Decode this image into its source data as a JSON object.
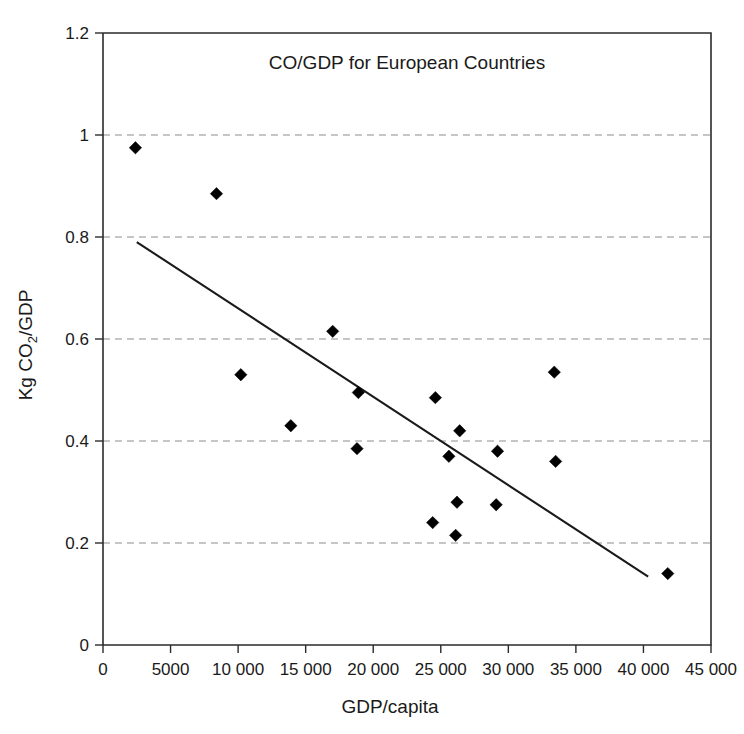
{
  "chart_data": {
    "type": "scatter",
    "title": "CO/GDP for European Countries",
    "xlabel": "GDP/capita",
    "ylabel": "Kg CO2/GDP",
    "ylabel_parts": {
      "prefix": "Kg CO",
      "sub": "2",
      "suffix": "/GDP"
    },
    "xlim": [
      0,
      45000
    ],
    "ylim": [
      0,
      1.2
    ],
    "grid": "horizontal-dashed",
    "legend": "none",
    "x_ticks": [
      0,
      5000,
      10000,
      15000,
      20000,
      25000,
      30000,
      35000,
      40000,
      45000
    ],
    "x_tick_labels": [
      "0",
      "5000",
      "10 000",
      "15 000",
      "20 000",
      "25 000",
      "30 000",
      "35 000",
      "40 000",
      "45 000"
    ],
    "y_ticks": [
      0,
      0.2,
      0.4,
      0.6,
      0.8,
      1,
      1.2
    ],
    "y_tick_labels": [
      "0",
      "0.2",
      "0.4",
      "0.6",
      "0.8",
      "1",
      "1.2"
    ],
    "marker_shape": "diamond",
    "marker_color": "#000000",
    "series": [
      {
        "name": "European countries",
        "points": [
          {
            "x": 2400,
            "y": 0.975
          },
          {
            "x": 8400,
            "y": 0.885
          },
          {
            "x": 10200,
            "y": 0.53
          },
          {
            "x": 13900,
            "y": 0.43
          },
          {
            "x": 17000,
            "y": 0.615
          },
          {
            "x": 18800,
            "y": 0.385
          },
          {
            "x": 18900,
            "y": 0.495
          },
          {
            "x": 24400,
            "y": 0.24
          },
          {
            "x": 24600,
            "y": 0.485
          },
          {
            "x": 25600,
            "y": 0.37
          },
          {
            "x": 26100,
            "y": 0.215
          },
          {
            "x": 26200,
            "y": 0.28
          },
          {
            "x": 26400,
            "y": 0.42
          },
          {
            "x": 29100,
            "y": 0.275
          },
          {
            "x": 29200,
            "y": 0.38
          },
          {
            "x": 33400,
            "y": 0.535
          },
          {
            "x": 33500,
            "y": 0.36
          },
          {
            "x": 41800,
            "y": 0.14
          }
        ]
      }
    ],
    "trendline": {
      "type": "linear",
      "x_start": 2500,
      "y_start": 0.79,
      "x_end": 40350,
      "y_end": 0.134
    }
  }
}
